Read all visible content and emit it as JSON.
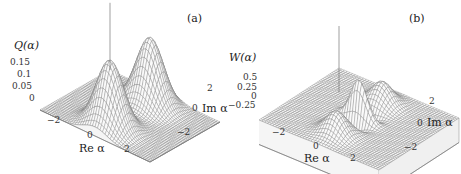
{
  "chart_data": [
    {
      "type": "surface3d",
      "panel_label": "(a)",
      "zlabel": "Q(α)",
      "xlabel": "Re α",
      "ylabel": "Im α",
      "z_ticks": [
        "0.15",
        "0.1",
        "0.05",
        "0"
      ],
      "x_ticks": [
        "−2",
        "0",
        "2"
      ],
      "y_ticks": [
        "2",
        "0",
        "−2"
      ],
      "xlim": [
        -3.5,
        3.5
      ],
      "ylim": [
        -3.5,
        3.5
      ],
      "zlim": [
        0,
        0.16
      ],
      "description": "Husimi Q-function of a cat state: two Gaussian peaks of height ~0.16 located at Im α ≈ ±2 (Re α ≈ 0)",
      "peaks": [
        {
          "re": 0,
          "im": 2,
          "height": 0.16
        },
        {
          "re": 0,
          "im": -2,
          "height": 0.16
        }
      ]
    },
    {
      "type": "surface3d",
      "panel_label": "(b)",
      "zlabel": "W(α)",
      "xlabel": "Re α",
      "ylabel": "Im α",
      "z_ticks": [
        "0.5",
        "0.25",
        "0",
        "−0.25"
      ],
      "x_ticks": [
        "−2",
        "0",
        "2"
      ],
      "y_ticks": [
        "2",
        "0",
        "−2"
      ],
      "xlim": [
        -3.5,
        3.5
      ],
      "ylim": [
        -3.5,
        3.5
      ],
      "zlim": [
        -0.35,
        0.6
      ],
      "description": "Wigner function of a cat state: two Gaussian peaks at Im α ≈ ±2 plus oscillating interference fringes near the origin reaching ~0.6 and negative values",
      "peaks": [
        {
          "re": 0,
          "im": 2,
          "height": 0.32
        },
        {
          "re": 0,
          "im": -2,
          "height": 0.32
        }
      ],
      "interference": {
        "center": [
          0,
          0
        ],
        "max": 0.6,
        "min": -0.3
      }
    }
  ]
}
